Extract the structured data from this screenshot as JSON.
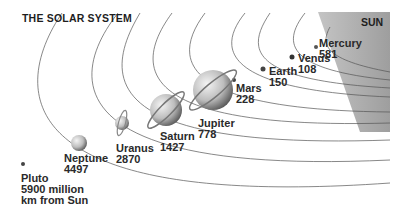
{
  "title": "THE SOLAR SYSTEM",
  "sun_label": "SUN",
  "unit_note": "million km from Sun",
  "planets": [
    {
      "name": "Mercury",
      "distance": "581"
    },
    {
      "name": "Venus",
      "distance": "108"
    },
    {
      "name": "Earth",
      "distance": "150"
    },
    {
      "name": "Mars",
      "distance": "228"
    },
    {
      "name": "Jupiter",
      "distance": "778"
    },
    {
      "name": "Saturn",
      "distance": "1427"
    },
    {
      "name": "Uranus",
      "distance": "2870"
    },
    {
      "name": "Neptune",
      "distance": "4497"
    },
    {
      "name": "Pluto",
      "distance": "5900 million",
      "note": "km from Sun"
    }
  ],
  "colors": {
    "sun": "#a9a9a9",
    "orbit": "#555555",
    "text": "#2a2a2a"
  }
}
